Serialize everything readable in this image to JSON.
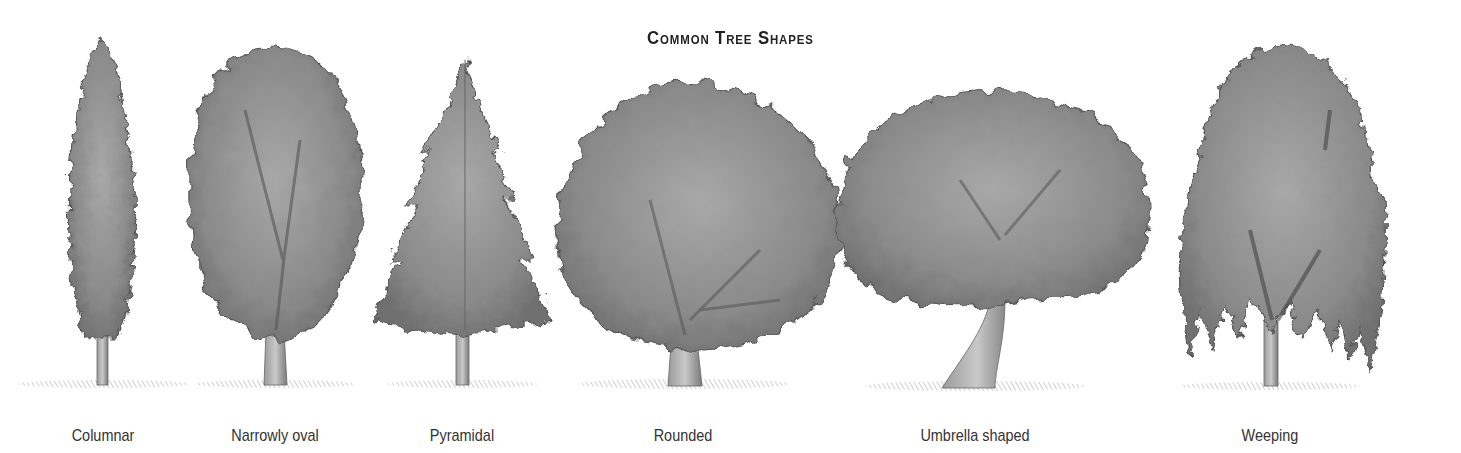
{
  "figure": {
    "title": "Common Tree Shapes",
    "background": "#ffffff",
    "ink_color": "#555555"
  },
  "trees": [
    {
      "id": "columnar",
      "label": "Columnar",
      "center_x": 100
    },
    {
      "id": "narrowly-oval",
      "label": "Narrowly oval",
      "center_x": 275
    },
    {
      "id": "pyramidal",
      "label": "Pyramidal",
      "center_x": 462
    },
    {
      "id": "rounded",
      "label": "Rounded",
      "center_x": 683
    },
    {
      "id": "umbrella-shaped",
      "label": "Umbrella shaped",
      "center_x": 970
    },
    {
      "id": "weeping",
      "label": "Weeping",
      "center_x": 1270
    }
  ]
}
